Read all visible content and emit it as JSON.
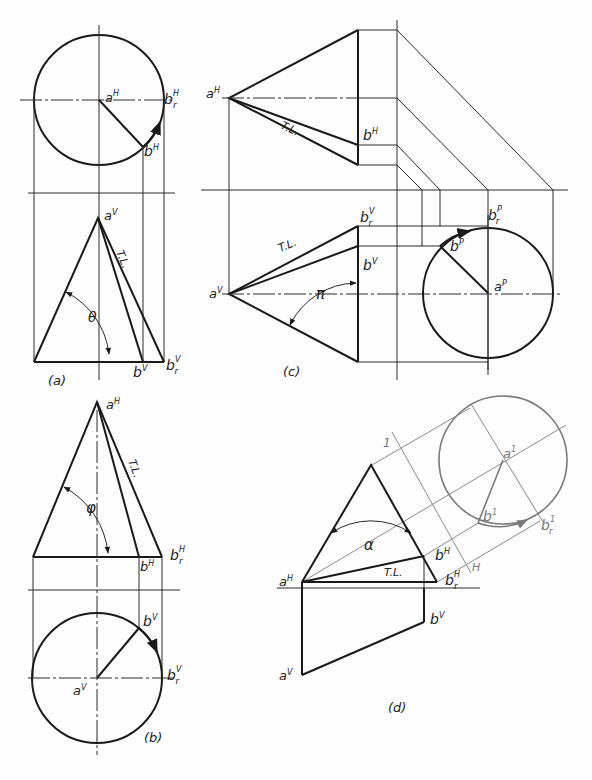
{
  "figure": {
    "panels": [
      {
        "id": "a",
        "caption": "(a)",
        "labels": {
          "aH": "a",
          "aH_sup": "H",
          "brH": "b",
          "brH_sup": "H",
          "brH_sub": "r",
          "bH": "b",
          "bH_sup": "H",
          "aV": "a",
          "aV_sup": "V",
          "tl": "T.L.",
          "angle": "θ",
          "bV": "b",
          "bV_sup": "V",
          "brV": "b",
          "brV_sup": "V",
          "brV_sub": "r"
        }
      },
      {
        "id": "b",
        "caption": "(b)",
        "labels": {
          "aH": "a",
          "aH_sup": "H",
          "tl": "T.L.",
          "angle": "φ",
          "bH": "b",
          "bH_sup": "H",
          "brH": "b",
          "brH_sup": "H",
          "brH_sub": "r",
          "bV": "b",
          "bV_sup": "V",
          "aV": "a",
          "aV_sup": "V",
          "brV": "b",
          "brV_sup": "V",
          "brV_sub": "r"
        }
      },
      {
        "id": "c",
        "caption": "(c)",
        "labels": {
          "aH": "a",
          "aH_sup": "H",
          "tl_top": "T.L.",
          "bH": "b",
          "bH_sup": "H",
          "brV": "b",
          "brV_sup": "V",
          "brV_sub": "r",
          "tl_bottom": "T.L.",
          "bV": "b",
          "bV_sup": "V",
          "aV": "a",
          "aV_sup": "V",
          "angle": "π",
          "brP": "b",
          "brP_sup": "P",
          "brP_sub": "r",
          "bP": "b",
          "bP_sup": "P",
          "aP": "a",
          "aP_sup": "P"
        }
      },
      {
        "id": "d",
        "caption": "(d)",
        "labels": {
          "one": "1",
          "a1": "a",
          "a1_sup": "1",
          "b1": "b",
          "b1_sup": "1",
          "br1": "b",
          "br1_sup": "1",
          "br1_sub": "r",
          "angle": "α",
          "bH": "b",
          "bH_sup": "H",
          "tl": "T.L.",
          "aH": "a",
          "aH_sup": "H",
          "brH": "b",
          "brH_sup": "H",
          "brH_sub": "r",
          "H": "H",
          "bV": "b",
          "bV_sup": "V",
          "aV": "a",
          "aV_sup": "V"
        }
      }
    ]
  }
}
